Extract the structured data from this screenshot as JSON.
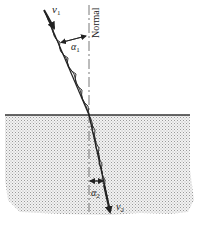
{
  "diagram": {
    "labels": {
      "incident_velocity": "v",
      "incident_velocity_sub": "1",
      "refracted_velocity": "v",
      "refracted_velocity_sub": "2",
      "incident_angle": "α",
      "incident_angle_sub": "1",
      "refracted_angle": "α",
      "refracted_angle_sub": "2",
      "normal": "Normal"
    },
    "colors": {
      "line": "#222222",
      "medium2_fill": "#d9d9d9",
      "normal_line": "#555555"
    }
  }
}
